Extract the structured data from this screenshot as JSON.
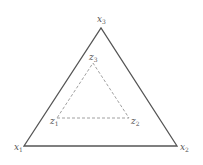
{
  "diagram": {
    "outer_triangle": {
      "style": "solid",
      "color": "#555555",
      "vertices": [
        {
          "id": "x1",
          "base": "x",
          "sub": "1",
          "x": 24,
          "y": 146,
          "label_x": 14,
          "label_y": 150
        },
        {
          "id": "x2",
          "base": "x",
          "sub": "2",
          "x": 177,
          "y": 146,
          "label_x": 180,
          "label_y": 150
        },
        {
          "id": "x3",
          "base": "x",
          "sub": "3",
          "x": 101,
          "y": 28,
          "label_x": 97,
          "label_y": 22
        }
      ]
    },
    "inner_triangle": {
      "style": "dashed",
      "color": "#888888",
      "vertices": [
        {
          "id": "z1",
          "base": "z",
          "sub": "1",
          "x": 57,
          "y": 118,
          "label_x": 50,
          "label_y": 124
        },
        {
          "id": "z2",
          "base": "z",
          "sub": "2",
          "x": 129,
          "y": 118,
          "label_x": 131,
          "label_y": 124
        },
        {
          "id": "z3",
          "base": "z",
          "sub": "3",
          "x": 93,
          "y": 63,
          "label_x": 89,
          "label_y": 60
        }
      ]
    }
  }
}
